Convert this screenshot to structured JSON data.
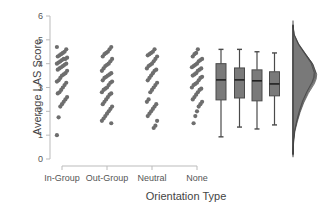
{
  "chart_data": {
    "type": "raincloud",
    "title": "",
    "xlabel": "Orientation Type",
    "ylabel": "Average LAS Score",
    "ylim": [
      0,
      6
    ],
    "yticks": [
      0,
      1,
      2,
      3,
      4,
      5,
      6
    ],
    "grid": false,
    "legend": null,
    "categories": [
      "In-Group",
      "Out-Group",
      "Neutral",
      "None"
    ],
    "strip_points": [
      {
        "category": "In-Group",
        "values": [
          4.7,
          4.6,
          4.5,
          4.45,
          4.4,
          4.35,
          4.3,
          4.25,
          4.2,
          4.2,
          4.15,
          4.1,
          4.05,
          4.0,
          4.0,
          3.95,
          3.9,
          3.85,
          3.8,
          3.75,
          3.7,
          3.6,
          3.55,
          3.5,
          3.4,
          3.3,
          3.25,
          3.2,
          3.1,
          3.0,
          2.9,
          2.8,
          2.75,
          2.6,
          2.5,
          2.4,
          2.3,
          2.2,
          1.75,
          1.0
        ]
      },
      {
        "category": "Out-Group",
        "values": [
          4.7,
          4.6,
          4.5,
          4.45,
          4.4,
          4.3,
          4.2,
          4.1,
          4.0,
          3.95,
          3.9,
          3.8,
          3.7,
          3.6,
          3.55,
          3.5,
          3.45,
          3.4,
          3.3,
          3.25,
          3.2,
          3.1,
          3.0,
          2.95,
          2.9,
          2.8,
          2.75,
          2.7,
          2.6,
          2.5,
          2.4,
          2.3,
          2.2,
          2.1,
          2.0,
          1.9,
          1.8,
          1.7,
          1.6,
          1.5
        ]
      },
      {
        "category": "Neutral",
        "values": [
          4.6,
          4.5,
          4.45,
          4.4,
          4.35,
          4.3,
          4.2,
          4.1,
          4.0,
          3.95,
          3.9,
          3.8,
          3.75,
          3.7,
          3.6,
          3.5,
          3.4,
          3.3,
          3.2,
          3.1,
          3.0,
          2.9,
          2.8,
          2.5,
          2.4,
          2.3,
          2.2,
          2.1,
          2.0,
          1.9,
          1.8,
          1.6,
          1.4,
          1.3
        ]
      },
      {
        "category": "None",
        "values": [
          4.6,
          4.45,
          4.4,
          4.3,
          4.2,
          4.15,
          4.1,
          4.0,
          3.95,
          3.9,
          3.85,
          3.8,
          3.75,
          3.7,
          3.6,
          3.55,
          3.5,
          3.45,
          3.4,
          3.3,
          3.2,
          3.15,
          3.1,
          3.0,
          2.95,
          2.9,
          2.8,
          2.7,
          2.6,
          2.5,
          2.4,
          2.3,
          2.2,
          2.0,
          1.8,
          1.5
        ]
      }
    ],
    "boxplots": [
      {
        "category": "In-Group",
        "min": 0.93,
        "q1": 2.48,
        "median": 3.32,
        "q3": 4.0,
        "max": 4.6
      },
      {
        "category": "Out-Group",
        "min": 1.34,
        "q1": 2.56,
        "median": 3.32,
        "q3": 3.82,
        "max": 4.6
      },
      {
        "category": "Neutral",
        "min": 1.26,
        "q1": 2.44,
        "median": 3.28,
        "q3": 3.74,
        "max": 4.5
      },
      {
        "category": "None",
        "min": 1.43,
        "q1": 2.65,
        "median": 3.15,
        "q3": 3.66,
        "max": 4.45
      }
    ],
    "density": {
      "description": "Overlaid half-violin density curves for the four groups, sharing a baseline",
      "range": [
        0.2,
        5.6
      ],
      "peak_at": 3.5,
      "y": [
        5.6,
        5.2,
        4.8,
        4.4,
        4.0,
        3.6,
        3.4,
        3.2,
        2.8,
        2.4,
        2.0,
        1.6,
        1.2,
        0.8,
        0.2
      ],
      "density": [
        0.0,
        0.05,
        0.25,
        0.55,
        0.85,
        1.0,
        0.98,
        0.9,
        0.65,
        0.45,
        0.3,
        0.18,
        0.08,
        0.03,
        0.0
      ]
    },
    "colors": {
      "points": "#6e6e6e",
      "box_fill": "#7a7a7a",
      "box_edge": "#4a4a4a",
      "median": "#222222",
      "density_fill": "#5a5a5a",
      "axis": "#bbbbbb",
      "text": "#555555"
    }
  }
}
